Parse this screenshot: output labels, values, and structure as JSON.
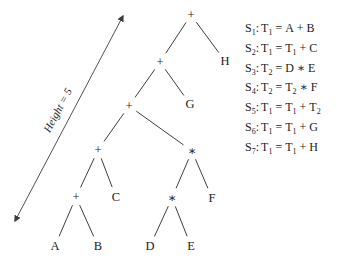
{
  "figure": {
    "background": "#ffffff",
    "ink_color": "#1c1c1c",
    "line_color": "#3d3d3d"
  },
  "height_arrow": {
    "label": "Height = 5",
    "x1": 15,
    "y1": 221,
    "x2": 123,
    "y2": 16,
    "label_x": 61,
    "label_y": 112,
    "label_angle_deg": -62
  },
  "tree": {
    "nodes": [
      {
        "id": "plus-root",
        "label": "+",
        "x": 191,
        "y": 15
      },
      {
        "id": "plus-l1",
        "label": "+",
        "x": 160,
        "y": 62
      },
      {
        "id": "leaf-H",
        "label": "H",
        "x": 225,
        "y": 61
      },
      {
        "id": "plus-l2",
        "label": "+",
        "x": 129,
        "y": 106
      },
      {
        "id": "leaf-G",
        "label": "G",
        "x": 190,
        "y": 104
      },
      {
        "id": "plus-l3",
        "label": "+",
        "x": 98,
        "y": 150
      },
      {
        "id": "star-l3",
        "label": "∗",
        "x": 192,
        "y": 151
      },
      {
        "id": "plus-l4",
        "label": "+",
        "x": 76,
        "y": 197
      },
      {
        "id": "leaf-C",
        "label": "C",
        "x": 116,
        "y": 197
      },
      {
        "id": "star-l4",
        "label": "∗",
        "x": 172,
        "y": 198
      },
      {
        "id": "leaf-F",
        "label": "F",
        "x": 212,
        "y": 198
      },
      {
        "id": "leaf-A",
        "label": "A",
        "x": 55,
        "y": 246
      },
      {
        "id": "leaf-B",
        "label": "B",
        "x": 98,
        "y": 246
      },
      {
        "id": "leaf-D",
        "label": "D",
        "x": 150,
        "y": 246
      },
      {
        "id": "leaf-E",
        "label": "E",
        "x": 191,
        "y": 246
      }
    ],
    "edges": [
      [
        "plus-root",
        "plus-l1"
      ],
      [
        "plus-root",
        "leaf-H"
      ],
      [
        "plus-l1",
        "plus-l2"
      ],
      [
        "plus-l1",
        "leaf-G"
      ],
      [
        "plus-l2",
        "plus-l3"
      ],
      [
        "plus-l2",
        "star-l3"
      ],
      [
        "plus-l3",
        "plus-l4"
      ],
      [
        "plus-l3",
        "leaf-C"
      ],
      [
        "star-l3",
        "star-l4"
      ],
      [
        "star-l3",
        "leaf-F"
      ],
      [
        "plus-l4",
        "leaf-A"
      ],
      [
        "plus-l4",
        "leaf-B"
      ],
      [
        "star-l4",
        "leaf-D"
      ],
      [
        "star-l4",
        "leaf-E"
      ]
    ]
  },
  "statements": [
    {
      "name": "S1",
      "label": {
        "base": "S",
        "sub": "1"
      },
      "tokens": [
        {
          "base": "T",
          "sub": "1"
        },
        {
          "base": "="
        },
        {
          "base": "A"
        },
        {
          "base": "+"
        },
        {
          "base": "B"
        }
      ]
    },
    {
      "name": "S2",
      "label": {
        "base": "S",
        "sub": "2"
      },
      "tokens": [
        {
          "base": "T",
          "sub": "1"
        },
        {
          "base": "="
        },
        {
          "base": "T",
          "sub": "1"
        },
        {
          "base": "+"
        },
        {
          "base": "C"
        }
      ]
    },
    {
      "name": "S3",
      "label": {
        "base": "S",
        "sub": "3"
      },
      "tokens": [
        {
          "base": "T",
          "sub": "2"
        },
        {
          "base": "="
        },
        {
          "base": "D"
        },
        {
          "base": "∗"
        },
        {
          "base": "E"
        }
      ]
    },
    {
      "name": "S4",
      "label": {
        "base": "S",
        "sub": "4"
      },
      "tokens": [
        {
          "base": "T",
          "sub": "2"
        },
        {
          "base": "="
        },
        {
          "base": "T",
          "sub": "2"
        },
        {
          "base": "∗"
        },
        {
          "base": "F"
        }
      ]
    },
    {
      "name": "S5",
      "label": {
        "base": "S",
        "sub": "5"
      },
      "tokens": [
        {
          "base": "T",
          "sub": "1"
        },
        {
          "base": "="
        },
        {
          "base": "T",
          "sub": "1"
        },
        {
          "base": "+"
        },
        {
          "base": "T",
          "sub": "2"
        }
      ]
    },
    {
      "name": "S6",
      "label": {
        "base": "S",
        "sub": "6"
      },
      "tokens": [
        {
          "base": "T",
          "sub": "1"
        },
        {
          "base": "="
        },
        {
          "base": "T",
          "sub": "1"
        },
        {
          "base": "+"
        },
        {
          "base": "G"
        }
      ]
    },
    {
      "name": "S7",
      "label": {
        "base": "S",
        "sub": "7"
      },
      "tokens": [
        {
          "base": "T",
          "sub": "1"
        },
        {
          "base": "="
        },
        {
          "base": "T",
          "sub": "1"
        },
        {
          "base": "+"
        },
        {
          "base": "H"
        }
      ]
    }
  ]
}
